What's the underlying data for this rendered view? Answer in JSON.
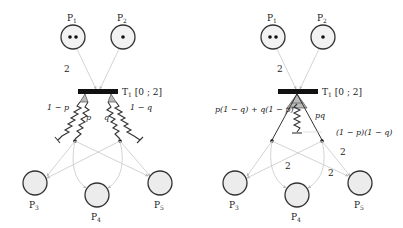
{
  "diagrams": [
    {
      "id": "left",
      "places": [
        {
          "label": "P",
          "sub": "1",
          "tokens": 2
        },
        {
          "label": "P",
          "sub": "2",
          "tokens": 1
        },
        {
          "label": "P",
          "sub": "3",
          "tokens": 0
        },
        {
          "label": "P",
          "sub": "4",
          "tokens": 0
        },
        {
          "label": "P",
          "sub": "5",
          "tokens": 0
        }
      ],
      "transition": {
        "label": "T",
        "sub": "1",
        "interval": "[0 ; 2]"
      },
      "arc_weights": {
        "p1_to_t1": "2"
      },
      "branches": [
        {
          "label": "1 − p"
        },
        {
          "label": "p"
        },
        {
          "label": "q"
        },
        {
          "label": "1 − q"
        }
      ]
    },
    {
      "id": "right",
      "places": [
        {
          "label": "P",
          "sub": "1",
          "tokens": 2
        },
        {
          "label": "P",
          "sub": "2",
          "tokens": 1
        },
        {
          "label": "P",
          "sub": "3",
          "tokens": 0
        },
        {
          "label": "P",
          "sub": "4",
          "tokens": 0
        },
        {
          "label": "P",
          "sub": "5",
          "tokens": 0
        }
      ],
      "transition": {
        "label": "T",
        "sub": "1",
        "interval": "[0 ; 2]"
      },
      "arc_weights": {
        "p1_to_t1": "2",
        "left_to_p4": "2",
        "right_to_p4": "2",
        "right_to_p5": "2"
      },
      "branches": [
        {
          "label": "p(1 − q) + q(1 − p)"
        },
        {
          "label": "pq"
        },
        {
          "label": "(1 − p)(1 − q)"
        }
      ]
    }
  ]
}
